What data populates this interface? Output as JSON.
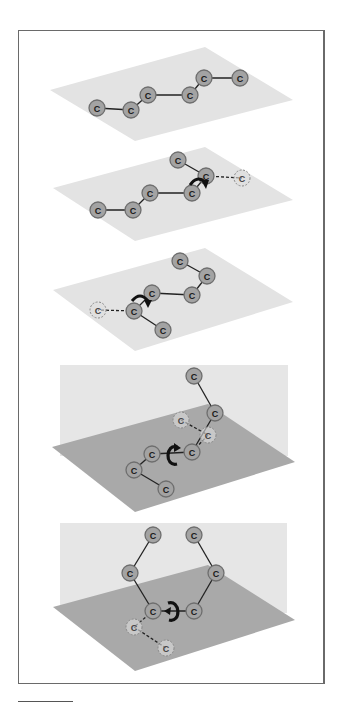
{
  "figure": {
    "atom_label": "C",
    "colors": {
      "frame": "#6a6a6a",
      "plane_light": "#e3e3e3",
      "vertical_plane": "#e6e6e6",
      "plane_dark": "#a9a9a9",
      "atom_fill": "#a3a3a3",
      "atom_stroke": "#6e6e6e",
      "ghost_fill": "#dddddd",
      "ghost_stroke": "#8a8a8a",
      "bond": "#222222",
      "arrow": "#111111"
    },
    "panels": [
      {
        "id": "panel-1",
        "description": "Zig-zag carbon chain lying flat in a plane",
        "plane": [
          [
            50,
            90
          ],
          [
            205,
            47
          ],
          [
            293,
            100
          ],
          [
            135,
            141
          ]
        ],
        "atoms": [
          [
            97,
            108
          ],
          [
            131,
            110
          ],
          [
            148,
            95
          ],
          [
            190,
            95
          ],
          [
            204,
            78
          ],
          [
            240,
            78
          ]
        ],
        "bonds": [
          [
            0,
            1
          ],
          [
            1,
            2
          ],
          [
            2,
            3
          ],
          [
            3,
            4
          ],
          [
            4,
            5
          ]
        ],
        "ghosts": [],
        "ghost_bonds": [],
        "rotation": null
      },
      {
        "id": "panel-2",
        "description": "Rotation about C4-C5 bond lifts end atom out of chain",
        "plane": [
          [
            53,
            188
          ],
          [
            205,
            147
          ],
          [
            293,
            200
          ],
          [
            135,
            241
          ]
        ],
        "atoms": [
          [
            98,
            210
          ],
          [
            133,
            210
          ],
          [
            150,
            193
          ],
          [
            192,
            193
          ],
          [
            206,
            176
          ],
          [
            178,
            160
          ]
        ],
        "bonds": [
          [
            0,
            1
          ],
          [
            1,
            2
          ],
          [
            2,
            3
          ],
          [
            3,
            4
          ],
          [
            4,
            5
          ]
        ],
        "ghosts": [
          [
            242,
            178
          ]
        ],
        "ghost_bonds": [
          [
            4,
            "g0"
          ]
        ],
        "rotation": {
          "cx": 199,
          "cy": 184,
          "dir": "right"
        }
      },
      {
        "id": "panel-3",
        "description": "Second rotation about C2-C3 bond",
        "plane": [
          [
            53,
            290
          ],
          [
            205,
            248
          ],
          [
            293,
            302
          ],
          [
            135,
            351
          ]
        ],
        "atoms": [
          [
            180,
            261
          ],
          [
            207,
            276
          ],
          [
            192,
            295
          ],
          [
            152,
            293
          ],
          [
            134,
            311
          ],
          [
            163,
            330
          ]
        ],
        "bonds": [
          [
            0,
            1
          ],
          [
            1,
            2
          ],
          [
            2,
            3
          ],
          [
            3,
            4
          ],
          [
            4,
            5
          ]
        ],
        "ghosts": [
          [
            98,
            310
          ]
        ],
        "ghost_bonds": [
          [
            4,
            "g0"
          ]
        ],
        "rotation": {
          "cx": 140,
          "cy": 303,
          "dir": "left"
        }
      },
      {
        "id": "panel-4",
        "description": "Chain folding out of plane via rotation about central bond",
        "vertical_plane": [
          60,
          365,
          288,
          456
        ],
        "plane": [
          [
            52,
            447
          ],
          [
            208,
            404
          ],
          [
            295,
            462
          ],
          [
            135,
            512
          ]
        ],
        "atoms": [
          [
            194,
            376
          ],
          [
            215,
            413
          ],
          [
            192,
            452
          ],
          [
            152,
            454
          ],
          [
            134,
            470
          ],
          [
            166,
            489
          ]
        ],
        "bonds": [
          [
            0,
            1
          ],
          [
            1,
            2
          ],
          [
            2,
            3
          ],
          [
            3,
            4
          ],
          [
            4,
            5
          ]
        ],
        "ghosts": [
          [
            181,
            420
          ],
          [
            208,
            435
          ]
        ],
        "ghost_bonds": [
          [
            "g0",
            "g1"
          ],
          [
            "g1",
            2
          ]
        ],
        "rotation": {
          "cx": 172,
          "cy": 455,
          "dir": "front"
        }
      },
      {
        "id": "panel-5",
        "description": "Chain folded into ring-like arrangement",
        "vertical_plane": [
          60,
          523,
          287,
          613
        ],
        "plane": [
          [
            53,
            607
          ],
          [
            208,
            565
          ],
          [
            295,
            620
          ],
          [
            135,
            671
          ]
        ],
        "atoms": [
          [
            153,
            535
          ],
          [
            194,
            535
          ],
          [
            130,
            573
          ],
          [
            216,
            573
          ],
          [
            153,
            611
          ],
          [
            194,
            611
          ]
        ],
        "bonds": [
          [
            0,
            2
          ],
          [
            2,
            4
          ],
          [
            4,
            5
          ],
          [
            5,
            3
          ],
          [
            3,
            1
          ]
        ],
        "ghosts": [
          [
            134,
            627
          ],
          [
            166,
            648
          ]
        ],
        "ghost_bonds": [
          [
            4,
            "g0"
          ],
          [
            "g0",
            "g1"
          ]
        ],
        "rotation": {
          "cx": 173,
          "cy": 611,
          "dir": "back"
        }
      }
    ]
  }
}
